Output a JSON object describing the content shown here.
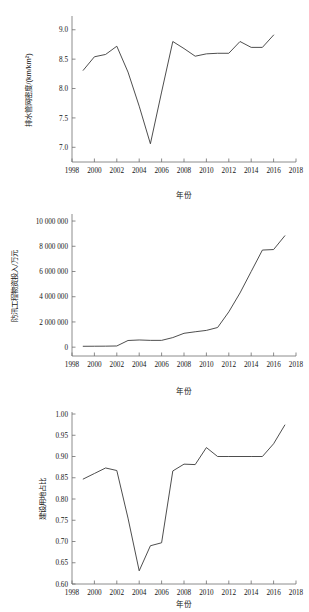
{
  "chart_data": [
    {
      "id": "drainage-pipe-density",
      "type": "line",
      "title": "",
      "xlabel": "年份",
      "ylabel": "排水管网密度/(km/km²)",
      "xlim": [
        1998,
        2018
      ],
      "ylim": [
        6.75,
        9.2
      ],
      "xticks": [
        1998,
        2000,
        2002,
        2004,
        2006,
        2008,
        2010,
        2012,
        2014,
        2016,
        2018
      ],
      "yticks": [
        7.0,
        7.5,
        8.0,
        8.5,
        9.0
      ],
      "ytick_labels": [
        "7.0",
        "7.5",
        "8.0",
        "8.5",
        "9.0"
      ],
      "grid": false,
      "legend": "none",
      "x": [
        1999,
        2000,
        2001,
        2002,
        2003,
        2004,
        2005,
        2006,
        2007,
        2008,
        2009,
        2010,
        2011,
        2012,
        2013,
        2014,
        2015,
        2016
      ],
      "values": [
        8.31,
        8.54,
        8.58,
        8.72,
        8.28,
        7.7,
        7.06,
        7.94,
        8.8,
        8.68,
        8.55,
        8.59,
        8.6,
        8.6,
        8.8,
        8.7,
        8.7,
        8.91
      ]
    },
    {
      "id": "flood-control-investment",
      "type": "line",
      "title": "",
      "xlabel": "年份",
      "ylabel": "防汛工程物资投入/万元",
      "xlim": [
        1998,
        2018
      ],
      "ylim": [
        -700000,
        10400000
      ],
      "xticks": [
        1998,
        2000,
        2002,
        2004,
        2006,
        2008,
        2010,
        2012,
        2014,
        2016,
        2018
      ],
      "yticks": [
        0,
        2000000,
        4000000,
        6000000,
        8000000,
        10000000
      ],
      "ytick_labels": [
        "0",
        "2 000 000",
        "4 000 000",
        "6 000 000",
        "8 000 000",
        "10 000 000"
      ],
      "grid": false,
      "legend": "none",
      "x": [
        1999,
        2000,
        2001,
        2002,
        2003,
        2004,
        2005,
        2006,
        2007,
        2008,
        2009,
        2010,
        2011,
        2012,
        2013,
        2014,
        2015,
        2016,
        2017
      ],
      "values": [
        70000,
        75000,
        80000,
        95000,
        530000,
        570000,
        540000,
        540000,
        760000,
        1100000,
        1220000,
        1330000,
        1560000,
        2800000,
        4300000,
        6000000,
        7700000,
        7740000,
        8830000
      ]
    },
    {
      "id": "construction-land-ratio",
      "type": "line",
      "title": "",
      "xlabel": "年份",
      "ylabel": "建设用地占比",
      "xlim": [
        1998,
        2018
      ],
      "ylim": [
        0.6,
        1.0
      ],
      "xticks": [
        1998,
        2000,
        2002,
        2004,
        2006,
        2008,
        2010,
        2012,
        2014,
        2016,
        2018
      ],
      "yticks": [
        0.6,
        0.65,
        0.7,
        0.75,
        0.8,
        0.85,
        0.9,
        0.95,
        1.0
      ],
      "ytick_labels": [
        "0.60",
        "0.65",
        "0.70",
        "0.75",
        "0.80",
        "0.85",
        "0.90",
        "0.95",
        "1.00"
      ],
      "grid": false,
      "legend": "none",
      "x": [
        1999,
        2000,
        2001,
        2002,
        2003,
        2004,
        2005,
        2006,
        2007,
        2008,
        2009,
        2010,
        2011,
        2012,
        2013,
        2014,
        2015,
        2016,
        2017
      ],
      "values": [
        0.847,
        0.86,
        0.873,
        0.867,
        0.755,
        0.631,
        0.69,
        0.697,
        0.866,
        0.882,
        0.881,
        0.921,
        0.9,
        0.9,
        0.9,
        0.9,
        0.9,
        0.93,
        0.974
      ]
    }
  ]
}
